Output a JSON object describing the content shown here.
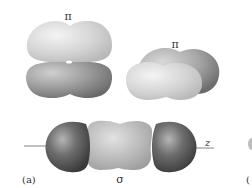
{
  "figure": {
    "panel_label": "(a)",
    "next_panel_label_fragment": "(",
    "orbitals": [
      {
        "id": "pi-vertical",
        "label": "π",
        "type": "pi bonding orbital (stacked lobes)"
      },
      {
        "id": "pi-tilted",
        "label": "π",
        "type": "pi bonding orbital (tilted)"
      },
      {
        "id": "sigma",
        "label": "σ",
        "type": "sigma bonding orbital along axis"
      }
    ],
    "axis_label": "z",
    "colors": {
      "light_lobe": "#d6d6d6",
      "mid_lobe": "#9a9a9a",
      "dark_lobe": "#555555",
      "axis_line": "#555555"
    }
  }
}
